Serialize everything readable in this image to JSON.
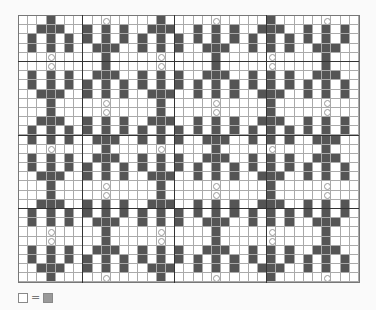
{
  "chart": {
    "cols": 37,
    "rows": 29,
    "cell_size": 9.2,
    "colors": {
      "dark": "#555555",
      "light": "#ffffff",
      "grid": "#aaaaaa",
      "thick": "#333333"
    },
    "thick_lines_cols": [
      7,
      17,
      27
    ],
    "thick_lines_rows": [
      5,
      13,
      21
    ],
    "motif_centers_cols": [
      3,
      9,
      15,
      21,
      27,
      33
    ],
    "motif_row_starts": [
      0,
      5,
      10,
      14,
      19,
      24
    ],
    "motifs": {
      "up": [
        "...X...",
        "..XXX..",
        ".X.X.X.",
        ".X.X.X.",
        "...O..."
      ],
      "down": [
        "...O...",
        ".X.X.X.",
        ".X.X.X.",
        "..XXX..",
        "...X..."
      ]
    },
    "layout": [
      [
        "up",
        "down",
        "up",
        "down",
        "up",
        "down"
      ],
      [
        "down",
        "up",
        "down",
        "up",
        "down",
        "up"
      ],
      [
        "up",
        "down",
        "up",
        "down",
        "up",
        "down"
      ],
      [
        "down",
        "up",
        "down",
        "up",
        "down",
        "up"
      ],
      [
        "up",
        "down",
        "up",
        "down",
        "up",
        "down"
      ],
      [
        "down",
        "up",
        "down",
        "up",
        "down",
        "up"
      ]
    ]
  },
  "legend": {
    "left_swatch": "white-square",
    "symbol": "=",
    "right_swatch": "gray-square"
  }
}
